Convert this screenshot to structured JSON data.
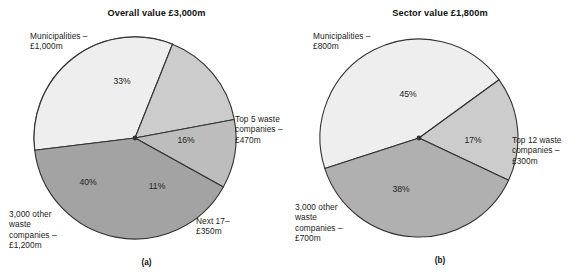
{
  "figure": {
    "width": 587,
    "height": 278,
    "background": "#ffffff"
  },
  "panels": [
    {
      "id": "a",
      "caption": "(a)",
      "title": "Overall value £3,000m",
      "callouts": {
        "municipalities": "Municipalities –\n£1,000m",
        "top_companies": "Top 5 waste\ncompanies –\n£470m",
        "next_tier": "Next 17–\n£350m",
        "other_companies": "3,000 other\nwaste\ncompanies –\n£1,200m"
      },
      "slice_labels": {
        "municipalities": "33%",
        "top_companies": "16%",
        "next_tier": "11%",
        "other_companies": "40%"
      }
    },
    {
      "id": "b",
      "caption": "(b)",
      "title": "Sector value £1,800m",
      "callouts": {
        "municipalities": "Municipalities –\n£800m",
        "top_companies": "Top 12 waste\ncompanies –\n£300m",
        "other_companies": "3,000 other\nwaste\ncompanies –\n£700m"
      },
      "slice_labels": {
        "municipalities": "45%",
        "top_companies": "17%",
        "other_companies": "38%"
      }
    }
  ],
  "chart_data": [
    {
      "type": "pie",
      "title": "Overall value £3,000m",
      "caption": "(a)",
      "total_label": "£3,000m",
      "total_value": 3000,
      "units": "£m",
      "legend": "outside-callouts",
      "start_angle_deg": -7,
      "direction": "clockwise",
      "categories": [
        "Municipalities",
        "Top 5 waste companies",
        "Next 17",
        "3,000 other waste companies"
      ],
      "values": [
        33,
        16,
        11,
        40
      ],
      "value_labels": [
        "33%",
        "16%",
        "11%",
        "40%"
      ],
      "amounts": [
        1000,
        470,
        350,
        1200
      ],
      "amount_labels": [
        "£1,000m",
        "£470m",
        "£350m",
        "£1,200m"
      ],
      "colors": [
        "#eeeeee",
        "#cccccc",
        "#bdbdbd",
        "#a3a3a3"
      ],
      "edge_color": "#333333"
    },
    {
      "type": "pie",
      "title": "Sector value £1,800m",
      "caption": "(b)",
      "total_label": "£1,800m",
      "total_value": 1800,
      "units": "£m",
      "legend": "outside-callouts",
      "start_angle_deg": -18,
      "direction": "clockwise",
      "categories": [
        "Municipalities",
        "Top 12 waste companies",
        "3,000 other waste companies"
      ],
      "values": [
        45,
        17,
        38
      ],
      "value_labels": [
        "45%",
        "17%",
        "38%"
      ],
      "amounts": [
        800,
        300,
        700
      ],
      "amount_labels": [
        "£800m",
        "£300m",
        "£700m"
      ],
      "colors": [
        "#eeeeee",
        "#cccccc",
        "#b0b0b0"
      ],
      "edge_color": "#333333"
    }
  ]
}
